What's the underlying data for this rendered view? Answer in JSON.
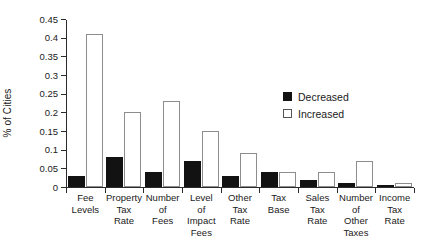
{
  "chart_data": {
    "type": "bar",
    "title": "",
    "xlabel": "",
    "ylabel": "% of Cities",
    "ylim": [
      0,
      0.45
    ],
    "yticks": [
      0,
      0.05,
      0.1,
      0.15,
      0.2,
      0.25,
      0.3,
      0.35,
      0.4,
      0.45
    ],
    "ytick_labels": [
      "0",
      "0.05",
      "0.1",
      "0.15",
      "0.2",
      "0.25",
      "0.3",
      "0.35",
      "0.4",
      "0.45"
    ],
    "grid": false,
    "legend_position": "upper right",
    "categories": [
      "Fee\nLevels",
      "Property\nTax\nRate",
      "Number\nof\nFees",
      "Level\nof\nImpact\nFees",
      "Other\nTax\nRate",
      "Tax\nBase",
      "Sales\nTax\nRate",
      "Number\nof\nOther\nTaxes",
      "Income\nTax\nRate"
    ],
    "series": [
      {
        "name": "Decreased",
        "color": "#121212",
        "values": [
          0.03,
          0.08,
          0.04,
          0.07,
          0.03,
          0.04,
          0.018,
          0.01,
          0
        ]
      },
      {
        "name": "Increased",
        "color": "#ffffff",
        "values": [
          0.41,
          0.2,
          0.23,
          0.15,
          0.09,
          0.039,
          0.039,
          0.07,
          0.01
        ]
      }
    ]
  },
  "legend": {
    "items": [
      {
        "label": "Decreased",
        "swatch": "filled-square-icon"
      },
      {
        "label": "Increased",
        "swatch": "outlined-square-icon"
      }
    ]
  }
}
